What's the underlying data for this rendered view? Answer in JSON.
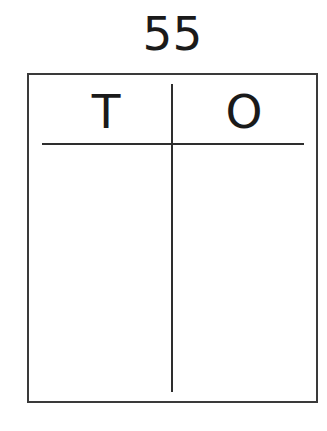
{
  "number": "55",
  "place_value_chart": {
    "columns": [
      {
        "label": "T",
        "meaning": "tens"
      },
      {
        "label": "O",
        "meaning": "ones"
      }
    ],
    "rows": []
  },
  "colors": {
    "ink": "#1a1a1a",
    "lines": "#2e2e2e",
    "background": "#ffffff"
  }
}
